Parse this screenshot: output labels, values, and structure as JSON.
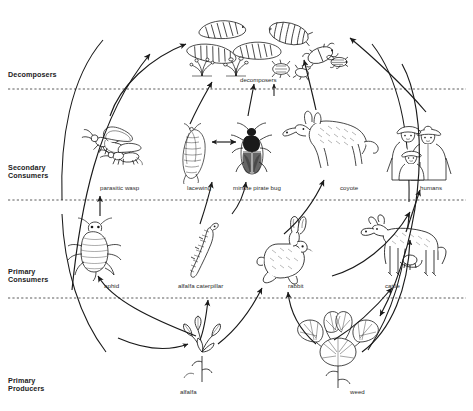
{
  "diagram": {
    "type": "ecological-food-web",
    "tiers": [
      {
        "id": "decomposers",
        "label": "Decomposers"
      },
      {
        "id": "secondary-consumers",
        "label": "Secondary\nConsumers"
      },
      {
        "id": "primary-consumers",
        "label": "Primary\nConsumers"
      },
      {
        "id": "primary-producers",
        "label": "Primary\nProducers"
      }
    ],
    "organisms": [
      {
        "id": "decomposers",
        "label": "decomposers",
        "tier": "decomposers"
      },
      {
        "id": "parasitic-wasp",
        "label": "parasitic wasp",
        "tier": "secondary-consumers"
      },
      {
        "id": "lacewing",
        "label": "lacewing",
        "tier": "secondary-consumers"
      },
      {
        "id": "minute-pirate-bug",
        "label": "minute pirate bug",
        "tier": "secondary-consumers"
      },
      {
        "id": "coyote",
        "label": "coyote",
        "tier": "secondary-consumers"
      },
      {
        "id": "humans",
        "label": "humans",
        "tier": "secondary-consumers"
      },
      {
        "id": "aphid",
        "label": "aphid",
        "tier": "primary-consumers"
      },
      {
        "id": "alfalfa-caterpillar",
        "label": "alfalfa caterpillar",
        "tier": "primary-consumers"
      },
      {
        "id": "rabbit",
        "label": "rabbit",
        "tier": "primary-consumers"
      },
      {
        "id": "cattle",
        "label": "cattle",
        "tier": "primary-consumers"
      },
      {
        "id": "alfalfa",
        "label": "alfalfa",
        "tier": "primary-producers"
      },
      {
        "id": "weed",
        "label": "weed",
        "tier": "primary-producers"
      }
    ],
    "colors": {
      "ink": "#1a1a1a",
      "background": "#ffffff",
      "tier_line": "#4a4a4a"
    }
  }
}
